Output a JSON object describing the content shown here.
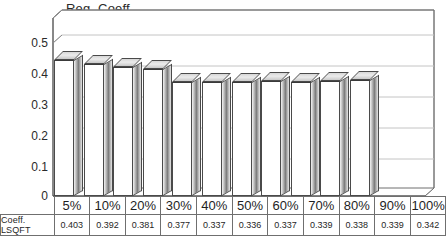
{
  "chart_data": {
    "type": "bar",
    "title": "",
    "ylabel": "Reg. Coeff.",
    "xlabel": "",
    "categories": [
      "5%",
      "10%",
      "20%",
      "30%",
      "40%",
      "50%",
      "60%",
      "70%",
      "80%",
      "90%",
      "100%"
    ],
    "series": [
      {
        "name": "Coeff. LSQFT",
        "values": [
          0.403,
          0.392,
          0.381,
          0.377,
          0.337,
          0.336,
          0.337,
          0.339,
          0.338,
          0.339,
          0.342
        ],
        "value_labels": [
          "0.403",
          "0.392",
          "0.381",
          "0.377",
          "0.337",
          "0.336",
          "0.337",
          "0.339",
          "0.338",
          "0.339",
          "0.342"
        ]
      }
    ],
    "ylim": [
      0,
      0.5
    ],
    "ytick_labels": [
      "0.5",
      "0.4",
      "0.3",
      "0.2",
      "0.1",
      "0"
    ],
    "ytick_values": [
      0.5,
      0.4,
      0.3,
      0.2,
      0.1,
      0
    ],
    "grid": true,
    "legend": "none",
    "style": "3d-column",
    "data_table_visible": true
  },
  "axis": {
    "y_title": "Reg. Coeff."
  },
  "data_table": {
    "row_header": "Coeff. LSQFT",
    "corner_label": ""
  },
  "caption": {
    "text": ""
  }
}
